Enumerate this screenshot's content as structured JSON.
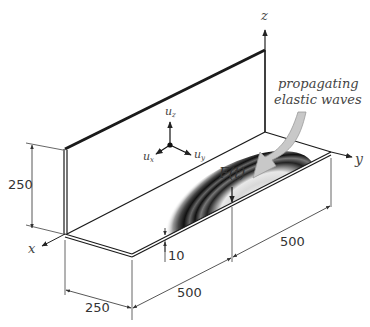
{
  "figure": {
    "type": "isometric-schematic"
  },
  "axes": {
    "x": "x",
    "y": "y",
    "z": "z"
  },
  "displacement_triad": {
    "ux": "u",
    "ux_sub": "x",
    "uy": "u",
    "uy_sub": "y",
    "uz": "u",
    "uz_sub": "z"
  },
  "load": {
    "label": "F(t)"
  },
  "annotation": {
    "line1": "propagating",
    "line2": "elastic waves"
  },
  "dimensions": {
    "height": "250",
    "width_x": "250",
    "length_front": "500",
    "length_back": "500",
    "thickness": "10"
  },
  "colors": {
    "line": "#1a1a1a",
    "dim_line": "#555555",
    "arrow_fill": "#c8c8c8",
    "arrow_stroke": "#9a9a9a",
    "text": "#333333"
  }
}
